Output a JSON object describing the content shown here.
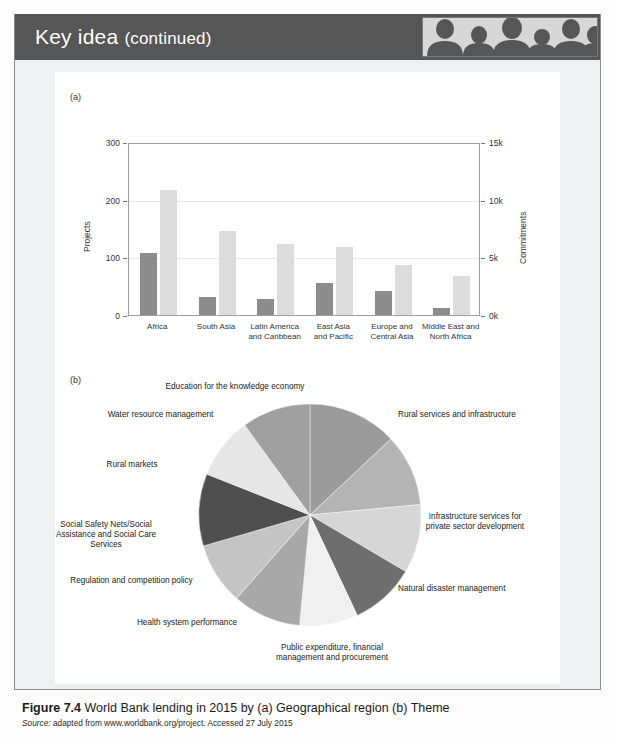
{
  "header": {
    "title_lead": "Key idea",
    "title_cont": "(continued)",
    "photo_alt": "people-silhouette-photo",
    "bar_color": "#565656"
  },
  "panels": {
    "a_letter": "(a)",
    "b_letter": "(b)"
  },
  "caption": {
    "figure_number": "Figure 7.4",
    "figure_text": "World Bank lending in 2015 by (a) Geographical region (b) Theme",
    "source_label": "Source:",
    "source_text": "adapted from www.worldbank.org/project. Accessed 27 July 2015"
  },
  "chart_data": [
    {
      "type": "bar",
      "title": "",
      "xlabel": "",
      "ylabel": "Projects",
      "y2label": "Commitments",
      "categories": [
        "Africa",
        "South Asia",
        "Latin America and Caribbean",
        "East Asia and Pacific",
        "Europe and Central Asia",
        "Middle East and North Africa"
      ],
      "category_lines": [
        [
          "Africa"
        ],
        [
          "South Asia"
        ],
        [
          "Latin America",
          "and Caribbean"
        ],
        [
          "East Asia",
          "and Pacific"
        ],
        [
          "Europe and",
          "Central Asia"
        ],
        [
          "Middle East and",
          "North Africa"
        ]
      ],
      "ylim": [
        0,
        300
      ],
      "yticks": [
        "0",
        "100",
        "200",
        "300"
      ],
      "ytick_values": [
        0,
        100,
        200,
        300
      ],
      "y2lim": [
        0,
        15000
      ],
      "y2ticks": [
        "0k",
        "5k",
        "10k",
        "15k"
      ],
      "y2tick_values": [
        0,
        5000,
        10000,
        15000
      ],
      "grid": true,
      "legend": "none",
      "series": [
        {
          "name": "Projects",
          "axis": "left",
          "color": "#8c8c8c",
          "values": [
            107,
            32,
            28,
            55,
            41,
            12
          ]
        },
        {
          "name": "Commitments",
          "axis": "right",
          "color": "#dcdcdc",
          "values": [
            10800,
            7300,
            6200,
            5900,
            4300,
            3400
          ]
        }
      ]
    },
    {
      "type": "pie",
      "title": "",
      "legend": "labels-around",
      "start_angle_deg": 0,
      "slices": [
        {
          "label": "Rural services and infrastructure",
          "value": 13.0,
          "color": "#9b9b9b"
        },
        {
          "label": "Infrastructure services for private sector development",
          "value": 10.5,
          "color": "#b4b4b4"
        },
        {
          "label": "Natural disaster management",
          "value": 10.0,
          "color": "#d6d6d6"
        },
        {
          "label": "Public expenditure, financial management and procurement",
          "value": 9.5,
          "color": "#6e6e6e"
        },
        {
          "label": "Health system performance",
          "value": 8.5,
          "color": "#f0f0f0"
        },
        {
          "label": "Regulation and competition policy",
          "value": 10.0,
          "color": "#a8a8a8"
        },
        {
          "label": "Social Safety Nets/Social Assistance and Social Care Services",
          "value": 9.0,
          "color": "#c4c4c4"
        },
        {
          "label": "Rural markets",
          "value": 10.5,
          "color": "#4f4f4f"
        },
        {
          "label": "Water resource management",
          "value": 9.0,
          "color": "#e6e6e6"
        },
        {
          "label": "Education for the knowledge economy",
          "value": 10.0,
          "color": "#a0a0a0"
        }
      ],
      "label_lines": [
        [
          "Rural services and infrastructure"
        ],
        [
          "Infrastructure services for",
          "private sector development"
        ],
        [
          "Natural disaster management"
        ],
        [
          "Public expenditure, financial",
          "management and procurement"
        ],
        [
          "Health system performance"
        ],
        [
          "Regulation and competition policy"
        ],
        [
          "Social Safety Nets/Social",
          "Assistance and Social Care",
          "Services"
        ],
        [
          "Rural markets"
        ],
        [
          "Water resource management"
        ],
        [
          "Education for the knowledge economy"
        ]
      ]
    }
  ]
}
